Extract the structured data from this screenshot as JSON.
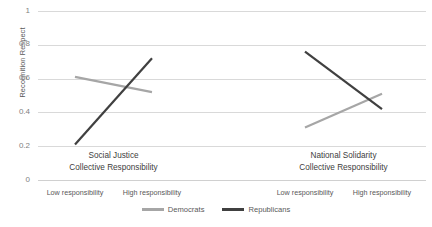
{
  "chart_data": {
    "type": "line",
    "title": "",
    "xlabel": "",
    "ylabel": "Recognition Respect",
    "ylim": [
      0,
      1
    ],
    "yticks": [
      "0",
      "0.2",
      "0.4",
      "0.6",
      "0.8",
      "1"
    ],
    "grid": true,
    "legend_position": "bottom-center",
    "panels": [
      {
        "title_line1": "Social Justice",
        "title_line2": "Collective Responsibility",
        "categories": [
          "Low responsibility",
          "High responsibility"
        ],
        "series": [
          {
            "name": "Democrats",
            "values": [
              0.61,
              0.52
            ],
            "color": "#A6A6A6"
          },
          {
            "name": "Republicans",
            "values": [
              0.21,
              0.72
            ],
            "color": "#404040"
          }
        ]
      },
      {
        "title_line1": "National Solidarity",
        "title_line2": "Collective Responsibility",
        "categories": [
          "Low responsibility",
          "High responsibility"
        ],
        "series": [
          {
            "name": "Democrats",
            "values": [
              0.31,
              0.51
            ],
            "color": "#A6A6A6"
          },
          {
            "name": "Republicans",
            "values": [
              0.76,
              0.42
            ],
            "color": "#404040"
          }
        ]
      }
    ],
    "legend": [
      {
        "label": "Democrats",
        "color": "#A6A6A6"
      },
      {
        "label": "Republicans",
        "color": "#404040"
      }
    ]
  }
}
